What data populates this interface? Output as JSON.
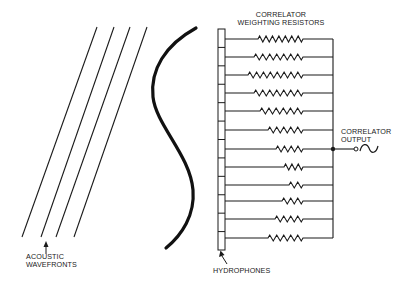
{
  "labels": {
    "resistors_line1": "CORRELATOR",
    "resistors_line2": "WEIGHTING RESISTORS",
    "output_line1": "CORRELATOR",
    "output_line2": "OUTPUT",
    "wavefronts_line1": "ACOUSTIC",
    "wavefronts_line2": "WAVEFRONTS",
    "hydrophones": "HYDROPHONES"
  },
  "colors": {
    "ink": "#1a1a1a",
    "background": "#ffffff"
  },
  "wavefronts": [
    {
      "x1": 97,
      "y1": 27,
      "x2": 22,
      "y2": 237
    },
    {
      "x1": 114,
      "y1": 27,
      "x2": 41,
      "y2": 237
    },
    {
      "x1": 130,
      "y1": 27,
      "x2": 56,
      "y2": 237
    },
    {
      "x1": 147,
      "y1": 27,
      "x2": 74,
      "y2": 237
    }
  ],
  "hydrophone_array": {
    "x": 218,
    "y": 29,
    "width": 7,
    "height": 221,
    "elements": 12
  },
  "channels": [
    {
      "y": 39,
      "resistor_start": 258,
      "peaks": 7
    },
    {
      "y": 57,
      "resistor_start": 254,
      "peaks": 7
    },
    {
      "y": 75,
      "resistor_start": 248,
      "peaks": 8
    },
    {
      "y": 93,
      "resistor_start": 254,
      "peaks": 7
    },
    {
      "y": 111,
      "resistor_start": 260,
      "peaks": 6
    },
    {
      "y": 130,
      "resistor_start": 268,
      "peaks": 5
    },
    {
      "y": 149,
      "resistor_start": 276,
      "peaks": 4
    },
    {
      "y": 167,
      "resistor_start": 284,
      "peaks": 3
    },
    {
      "y": 185,
      "resistor_start": 289,
      "peaks": 2
    },
    {
      "y": 201,
      "resistor_start": 282,
      "peaks": 3
    },
    {
      "y": 219,
      "resistor_start": 275,
      "peaks": 4
    },
    {
      "y": 238,
      "resistor_start": 268,
      "peaks": 5
    }
  ],
  "resistor_end_x": 303,
  "bus_x": 333,
  "output": {
    "junction_y": 149,
    "terminal_x": 356
  }
}
